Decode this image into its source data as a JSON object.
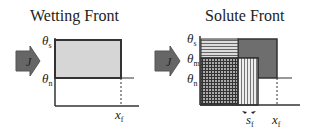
{
  "panels": [
    {
      "title": "Wetting Front",
      "flux_label": "J",
      "y_labels": [
        "θs",
        "θn"
      ],
      "x_labels": [
        "xf"
      ]
    },
    {
      "title": "Solute Front",
      "flux_label": "J",
      "y_labels": [
        "θs",
        "θm",
        "θn"
      ],
      "x_labels": [
        "sf",
        "xf"
      ]
    }
  ]
}
